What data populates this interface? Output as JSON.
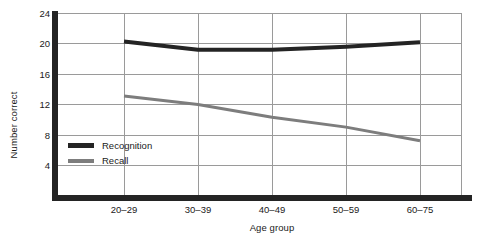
{
  "chart_data": {
    "type": "line",
    "title": "",
    "xlabel": "Age group",
    "ylabel": "Number correct",
    "categories": [
      "20–29",
      "30–39",
      "40–49",
      "50–59",
      "60–75"
    ],
    "yticks": [
      4,
      8,
      12,
      16,
      20,
      24
    ],
    "ylim": [
      0,
      24
    ],
    "grid": "both",
    "legend_position": "inside-lower-left",
    "series": [
      {
        "name": "Recognition",
        "color": "#242424",
        "line_width": 4,
        "values": [
          20.3,
          19.2,
          19.2,
          19.6,
          20.2
        ]
      },
      {
        "name": "Recall",
        "color": "#7d7d7d",
        "line_width": 3,
        "values": [
          13.1,
          12.0,
          10.3,
          9.0,
          7.2
        ]
      }
    ]
  },
  "axes": {
    "y_title": "Number correct",
    "x_title": "Age group",
    "y_tick_labels": [
      "24",
      "20",
      "16",
      "12",
      "8",
      "4"
    ],
    "x_tick_labels": [
      "20–29",
      "30–39",
      "40–49",
      "50–59",
      "60–75"
    ]
  },
  "legend": {
    "items": [
      {
        "label": "Recognition",
        "swatch": "recognition-line-swatch"
      },
      {
        "label": "Recall",
        "swatch": "recall-line-swatch"
      }
    ]
  },
  "colors": {
    "recognition": "#242424",
    "recall": "#7d7d7d",
    "grid": "#9a9a9a",
    "spine": "#242424",
    "background": "#ffffff",
    "text": "#1a1a1a"
  }
}
